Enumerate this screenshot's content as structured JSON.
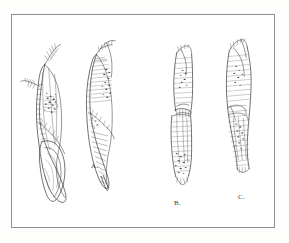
{
  "plate": {
    "medium": "pen-and-ink line drawing",
    "frame_color": "#8d8e8f",
    "page_color": "#fdfdfc",
    "plate_background": "#ffffff",
    "ink_color": "#2f2f2f"
  },
  "labels": {
    "a": "A.",
    "b": "B.",
    "c": "C."
  },
  "figures": [
    {
      "id": "figure-a-left",
      "label_ref": "a",
      "description": "elongated tapering specimen with bulbous pointed tip",
      "x": 58,
      "y": 128,
      "width": 46,
      "height": 140
    },
    {
      "id": "figure-a-right",
      "label_ref": "a",
      "description": "elongated specimen with hatched upper surface and sharp pointed tip",
      "x": 104,
      "y": 115,
      "width": 44,
      "height": 128
    },
    {
      "id": "figure-b",
      "label_ref": "b",
      "description": "slender columnar specimen with overlapping sheath near midpoint",
      "x": 172,
      "y": 120,
      "width": 34,
      "height": 140
    },
    {
      "id": "figure-c",
      "label_ref": "c",
      "description": "columnar specimen with angled apex and banded texture",
      "x": 226,
      "y": 112,
      "width": 38,
      "height": 134
    }
  ]
}
